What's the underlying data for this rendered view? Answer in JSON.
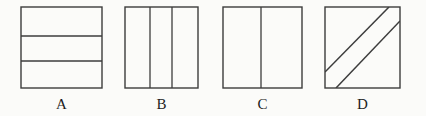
{
  "figure": {
    "background_color": "#fbfbf9",
    "line_color": "#3c3c3c",
    "label_color": "#1d1d1d",
    "canvas": {
      "width": 426,
      "height": 116
    },
    "items": [
      {
        "id": "a",
        "label": "A",
        "division": "three-horizontal-strips",
        "orientation": "horizontal",
        "parts": 3,
        "box": {
          "x": 20,
          "y": 6,
          "width": 83,
          "height": 83
        },
        "divider_fractions": [
          0.355,
          0.655
        ]
      },
      {
        "id": "b",
        "label": "B",
        "division": "three-vertical-strips",
        "orientation": "vertical",
        "parts": 3,
        "box": {
          "x": 124,
          "y": 6,
          "width": 75,
          "height": 83
        },
        "divider_fractions": [
          0.35,
          0.64
        ]
      },
      {
        "id": "c",
        "label": "C",
        "division": "two-vertical-halves",
        "orientation": "vertical",
        "parts": 2,
        "box": {
          "x": 222,
          "y": 6,
          "width": 81,
          "height": 83
        },
        "divider_fractions": [
          0.48
        ]
      },
      {
        "id": "d",
        "label": "D",
        "division": "two-parallel-diagonals",
        "orientation": "diagonal",
        "parts": 3,
        "box": {
          "x": 324,
          "y": 6,
          "width": 77,
          "height": 83
        },
        "diagonals": [
          {
            "x1": 0.0,
            "y1": 0.79,
            "x2": 0.84,
            "y2": 0.0
          },
          {
            "x1": 0.15,
            "y1": 1.0,
            "x2": 1.0,
            "y2": 0.17
          }
        ]
      }
    ]
  }
}
